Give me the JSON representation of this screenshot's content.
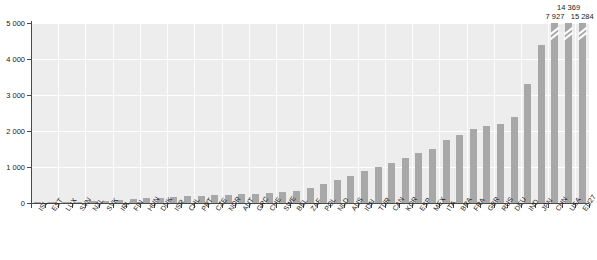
{
  "chart_data": {
    "type": "bar",
    "title": "",
    "subtitle": "",
    "xlabel": "",
    "ylabel": "",
    "ylim": [
      0,
      5000
    ],
    "grid": true,
    "gridlines_y": [
      1000,
      2000,
      3000,
      4000,
      5000
    ],
    "legend": null,
    "legend_position": "none",
    "thousands_separator": " ",
    "y_tick_labels": [
      "0",
      "1 000",
      "2 000",
      "3 000",
      "4 000",
      "5 000"
    ],
    "y_ticks": [
      0,
      1000,
      2000,
      3000,
      4000,
      5000
    ],
    "bar_color": "#a8a8a8",
    "plot_background": "#ededed",
    "axis_color": "#4a4a4a",
    "categories": [
      "ISL",
      "EST",
      "LUX",
      "SVN",
      "NZL",
      "SVK",
      "IRL",
      "FIN",
      "HUN",
      "DNK",
      "ISR",
      "CHL",
      "PRT",
      "CZE",
      "NOR",
      "AUT",
      "GRC",
      "CHE",
      "SWE",
      "BEL",
      "ZAF",
      "POL",
      "NLD",
      "AUS",
      "IDN",
      "TUR",
      "CAN",
      "KOR",
      "ESP",
      "MEX",
      "ITA",
      "BRA",
      "FRA",
      "GBR",
      "RUS",
      "DEU",
      "IND",
      "JPN",
      "CHN",
      "USA",
      "EU27"
    ],
    "values": [
      12,
      24,
      30,
      42,
      55,
      70,
      95,
      110,
      130,
      150,
      170,
      185,
      200,
      215,
      230,
      250,
      265,
      280,
      300,
      330,
      420,
      520,
      640,
      760,
      880,
      1010,
      1120,
      1250,
      1400,
      1500,
      1750,
      1900,
      2050,
      2150,
      2200,
      2400,
      3300,
      4400,
      7927,
      14369,
      15284
    ],
    "truncated_bars": [
      {
        "category": "CHN",
        "index": 38,
        "label": "7 927",
        "display_height": 5000
      },
      {
        "category": "USA",
        "index": 39,
        "label": "14 369",
        "display_height": 5000
      },
      {
        "category": "EU27",
        "index": 40,
        "label": "15 284",
        "display_height": 5000
      }
    ],
    "annotations": [
      {
        "category": "CHN",
        "text": "7 927"
      },
      {
        "category": "USA",
        "text": "14 369"
      },
      {
        "category": "EU27",
        "text": "15 284"
      }
    ]
  }
}
